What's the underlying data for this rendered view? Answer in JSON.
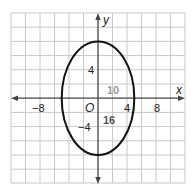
{
  "diagram": {
    "type": "ellipse-on-coordinate-grid",
    "grid": {
      "x_min": -10,
      "x_max": 14,
      "y_min": -12,
      "y_max": 12,
      "cell_units": 2,
      "line_color": "#c8c8c8"
    },
    "axes": {
      "x_label": "x",
      "y_label": "y",
      "origin_label": "O",
      "x_ticks": [
        {
          "value": -8,
          "label": "−8"
        },
        {
          "value": 4,
          "label": "4"
        },
        {
          "value": 8,
          "label": "8"
        }
      ],
      "y_ticks": [
        {
          "value": 4,
          "label": "4"
        },
        {
          "value": -4,
          "label": "−4"
        }
      ],
      "color": "#444444"
    },
    "ellipse": {
      "center": [
        0,
        0
      ],
      "horizontal_semi_axis": 5,
      "vertical_semi_axis": 8,
      "stroke_color": "#111111"
    },
    "annotations": [
      {
        "label": "10",
        "meaning": "minor axis length",
        "color": "#999999"
      },
      {
        "label": "16",
        "meaning": "major axis length",
        "color": "#555555"
      }
    ]
  }
}
